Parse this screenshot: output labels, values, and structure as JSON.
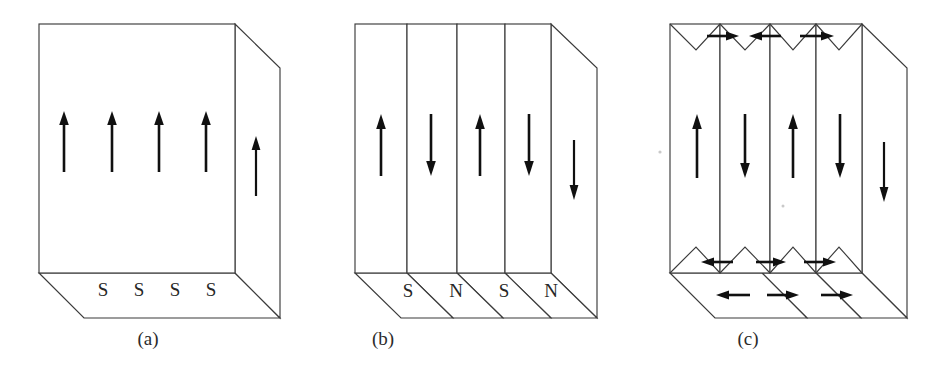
{
  "figure": {
    "background_color": "#ffffff",
    "line_color": "#3b3b3b",
    "arrow_color": "#101010",
    "text_color": "#2b2b2b"
  },
  "panels": [
    {
      "id": "a",
      "caption": "(a)",
      "caption_x": 148,
      "caption_y": 345,
      "front_arrows": [
        {
          "direction": "up",
          "x": 64
        },
        {
          "direction": "up",
          "x": 112
        },
        {
          "direction": "up",
          "x": 159
        },
        {
          "direction": "up",
          "x": 206
        }
      ],
      "side_arrows": [
        {
          "direction": "up",
          "x": 256
        }
      ],
      "bottom_labels": [
        {
          "text": "S",
          "x": 103
        },
        {
          "text": "S",
          "x": 139
        },
        {
          "text": "S",
          "x": 175
        },
        {
          "text": "S",
          "x": 211
        }
      ],
      "bottom_label_y": 296,
      "domain_count": 1
    },
    {
      "id": "b",
      "caption": "(b)",
      "caption_x": 383,
      "caption_y": 345,
      "front_arrows": [
        {
          "direction": "up",
          "x": 381
        },
        {
          "direction": "down",
          "x": 431
        },
        {
          "direction": "up",
          "x": 480
        },
        {
          "direction": "down",
          "x": 529
        }
      ],
      "side_arrows": [
        {
          "direction": "down",
          "x": 574
        }
      ],
      "bottom_labels": [
        {
          "text": "S",
          "x": 408
        },
        {
          "text": "N",
          "x": 456
        },
        {
          "text": "S",
          "x": 504
        },
        {
          "text": "N",
          "x": 551
        }
      ],
      "bottom_label_y": 297,
      "domain_count": 4
    },
    {
      "id": "c",
      "caption": "(c)",
      "caption_x": 748,
      "caption_y": 345,
      "front_arrows": [
        {
          "direction": "up",
          "x": 697
        },
        {
          "direction": "down",
          "x": 745
        },
        {
          "direction": "up",
          "x": 793
        },
        {
          "direction": "down",
          "x": 840
        }
      ],
      "side_arrows": [
        {
          "direction": "down",
          "x": 884
        }
      ],
      "top_closure_arrows": [
        {
          "direction": "right",
          "x": 721
        },
        {
          "direction": "left",
          "x": 769
        },
        {
          "direction": "right",
          "x": 817
        }
      ],
      "bottom_closure_arrows": [
        {
          "direction": "left",
          "x": 721
        },
        {
          "direction": "right",
          "x": 769
        },
        {
          "direction": "right",
          "x": 817
        }
      ],
      "base_face_arrows": [
        {
          "direction": "left",
          "x": 726
        },
        {
          "direction": "right",
          "x": 780
        },
        {
          "direction": "right",
          "x": 834
        }
      ],
      "bottom_labels": [],
      "domain_count": 4
    }
  ]
}
